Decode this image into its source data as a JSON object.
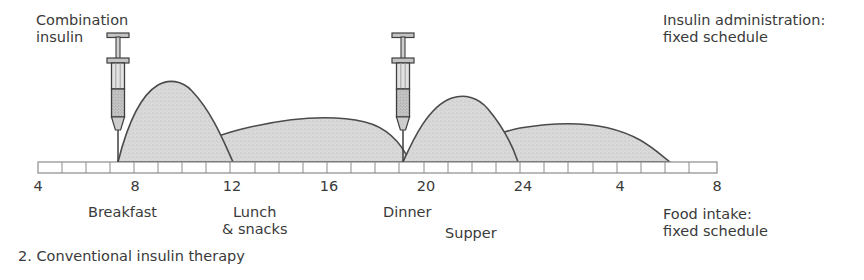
{
  "figure": {
    "caption": "2. Conventional insulin therapy",
    "annotations": {
      "injection_label": "Combination\ninsulin",
      "insulin_admin": "Insulin administration:\nfixed schedule",
      "food_intake": "Food intake:\nfixed schedule"
    },
    "meals": [
      {
        "name": "meal-breakfast",
        "label": "Breakfast",
        "hour": 8
      },
      {
        "name": "meal-lunch",
        "label": "Lunch\n& snacks",
        "hour": 12
      },
      {
        "name": "meal-dinner",
        "label": "Dinner",
        "hour": 19
      },
      {
        "name": "meal-supper",
        "label": "Supper",
        "hour": 22
      }
    ],
    "injections": [
      {
        "name": "syringe-morning",
        "hour": 7,
        "type": "combination-insulin"
      },
      {
        "name": "syringe-evening",
        "hour": 19,
        "type": "combination-insulin"
      }
    ]
  },
  "chart_data": {
    "type": "area",
    "title": "2. Conventional insulin therapy",
    "xlabel": "",
    "ylabel": "",
    "xlim": [
      4,
      32
    ],
    "ylim": [
      0,
      100
    ],
    "grid": false,
    "legend_position": "none",
    "axis_ticks_labeled": [
      "4",
      "8",
      "12",
      "16",
      "20",
      "24",
      "4",
      "8"
    ],
    "axis_tick_hours": [
      4,
      8,
      12,
      16,
      20,
      24,
      28,
      32
    ],
    "axis_minor_tick_interval_hours": 1,
    "series": [
      {
        "name": "short-acting insulin (morning dose)",
        "start_hour": 7,
        "peak_hour": 9.5,
        "end_hour": 12.4,
        "peak_value": 78
      },
      {
        "name": "long-acting insulin (morning dose)",
        "start_hour": 7,
        "peak_hour": 14.5,
        "end_hour": 21,
        "peak_value": 43
      },
      {
        "name": "short-acting insulin (evening dose)",
        "start_hour": 19,
        "peak_hour": 21.5,
        "end_hour": 24,
        "peak_value": 62
      },
      {
        "name": "long-acting insulin (evening dose)",
        "start_hour": 19,
        "peak_hour": 26,
        "end_hour": 30.5,
        "peak_value": 36
      }
    ],
    "annotations": [
      {
        "text": "Combination insulin",
        "at_hour": 7
      },
      {
        "text": "Insulin administration: fixed schedule",
        "at_hour": 30
      },
      {
        "text": "Food intake: fixed schedule",
        "at_hour": 30
      }
    ]
  },
  "colors": {
    "text": "#3a3a3a",
    "curve_outline": "#4b4b4b",
    "curve_fill": "#d9d9d9",
    "axis_line": "#8c8c8c",
    "syringe_outline": "#3f3f3f",
    "syringe_fill": "#b7b7b7",
    "background": "#ffffff"
  }
}
